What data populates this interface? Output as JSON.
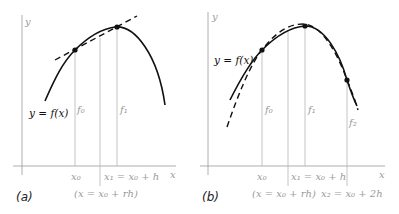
{
  "panel_a": {
    "label": "(a)",
    "y_axis_label": "y",
    "x_axis_label": "x",
    "curve_label": "y = f(x)",
    "ordinate_labels": [
      "f0",
      "f1"
    ],
    "ordinate_labels_display": {
      "f0": "f₀",
      "f1": "f₁"
    },
    "x_tick_labels": {
      "x0": "x₀",
      "x1": "x₁ = x₀ + h",
      "x": "(x = x₀ + rh)"
    },
    "description": "Linear interpolation: dashed secant line through (x0,f0) and (x1,f1) approximating curve y=f(x)"
  },
  "panel_b": {
    "label": "(b)",
    "y_axis_label": "y",
    "x_axis_label": "x",
    "curve_label": "y = f(x)",
    "ordinate_labels_display": {
      "f0": "f₀",
      "f1": "f₁",
      "f2": "f₂"
    },
    "x_tick_labels": {
      "x0": "x₀",
      "x1": "x₁ = x₀ + h",
      "x": "(x = x₀ + rh)",
      "x2": "x₂ = x₀ + 2h"
    },
    "description": "Quadratic interpolation: dashed parabola through (x0,f0), (x1,f1), (x2,f2) approximating curve y=f(x)"
  }
}
